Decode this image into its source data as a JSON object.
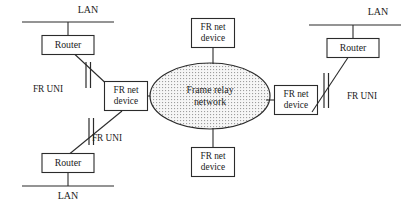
{
  "diagram": {
    "type": "network-topology",
    "background_color": "#ffffff",
    "line_color": "#2b2b2b",
    "cloud": {
      "name": "frame-relay-cloud",
      "label_line1": "Frame relay",
      "label_line2": "network",
      "fill_pattern": "stipple-dots",
      "fill_color": "#f4f4f4",
      "dot_color": "#9a9a9a",
      "cx": 210,
      "cy": 96,
      "rx": 60,
      "ry": 33
    },
    "lans": [
      {
        "id": "lan-top-left",
        "label": "LAN",
        "x": 68,
        "y": 22,
        "label_x": 88,
        "label_y": 11,
        "half_width": 46
      },
      {
        "id": "lan-top-right",
        "label": "LAN",
        "x": 355,
        "y": 22,
        "label_x": 378,
        "label_y": 11,
        "half_width": 46
      },
      {
        "id": "lan-bottom-left",
        "label": "LAN",
        "x": 68,
        "y": 186,
        "label_x": 68,
        "label_y": 198,
        "half_width": 46
      }
    ],
    "routers": [
      {
        "id": "router-top-left",
        "label": "Router",
        "x": 68,
        "y": 45,
        "w": 52,
        "h": 19
      },
      {
        "id": "router-top-right",
        "label": "Router",
        "x": 353,
        "y": 48,
        "w": 52,
        "h": 19
      },
      {
        "id": "router-bottom-left",
        "label": "Router",
        "x": 68,
        "y": 163,
        "w": 52,
        "h": 19
      }
    ],
    "fr_devices": [
      {
        "id": "fr-net-device-left",
        "line1": "FR net",
        "line2": "device",
        "x": 126,
        "y": 96,
        "w": 43,
        "h": 29
      },
      {
        "id": "fr-net-device-top",
        "line1": "FR net",
        "line2": "device",
        "x": 213,
        "y": 33,
        "w": 43,
        "h": 29
      },
      {
        "id": "fr-net-device-bottom",
        "line1": "FR net",
        "line2": "device",
        "x": 213,
        "y": 162,
        "w": 43,
        "h": 29
      },
      {
        "id": "fr-net-device-right",
        "line1": "FR net",
        "line2": "device",
        "x": 296,
        "y": 100,
        "w": 43,
        "h": 29
      }
    ],
    "uni_labels": [
      {
        "id": "fr-uni-top-left",
        "label": "FR UNI",
        "x": 48,
        "y": 90
      },
      {
        "id": "fr-uni-bottom-left",
        "label": "FR UNI",
        "x": 107,
        "y": 139
      },
      {
        "id": "fr-uni-right",
        "label": "FR UNI",
        "x": 362,
        "y": 97
      }
    ],
    "links": [
      {
        "id": "link-lan-tl-router",
        "from": "lan-top-left",
        "to": "router-top-left"
      },
      {
        "id": "link-router-tl-frdev",
        "from": "router-top-left",
        "to": "fr-net-device-left",
        "has_uni_marker": true
      },
      {
        "id": "link-lan-bl-router",
        "from": "lan-bottom-left",
        "to": "router-bottom-left"
      },
      {
        "id": "link-router-bl-frdev",
        "from": "router-bottom-left",
        "to": "fr-net-device-left",
        "has_uni_marker": true
      },
      {
        "id": "link-frdev-left-cloud",
        "from": "fr-net-device-left",
        "to": "frame-relay-cloud"
      },
      {
        "id": "link-frdev-top-cloud",
        "from": "fr-net-device-top",
        "to": "frame-relay-cloud"
      },
      {
        "id": "link-frdev-bottom-cloud",
        "from": "fr-net-device-bottom",
        "to": "frame-relay-cloud"
      },
      {
        "id": "link-cloud-frdev-right",
        "from": "frame-relay-cloud",
        "to": "fr-net-device-right"
      },
      {
        "id": "link-frdev-right-router",
        "from": "fr-net-device-right",
        "to": "router-top-right",
        "has_uni_marker": true
      },
      {
        "id": "link-lan-tr-router",
        "from": "lan-top-right",
        "to": "router-top-right"
      }
    ]
  }
}
